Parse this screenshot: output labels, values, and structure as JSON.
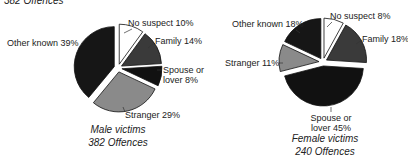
{
  "top_caption_partial": "382 Offences",
  "colors": {
    "No suspect": "#ffffff",
    "Family": "#3a3a3a",
    "Spouse or lover": "#111111",
    "Stranger": "#8a8a8a",
    "Other known": "#161616"
  },
  "chart_data": [
    {
      "type": "pie",
      "title": "Male victims",
      "subtitle": "382 Offences",
      "slices": [
        {
          "label": "No suspect",
          "value": 10,
          "display": "No suspect 10%"
        },
        {
          "label": "Family",
          "value": 14,
          "display": "Family 14%"
        },
        {
          "label": "Spouse or lover",
          "value": 8,
          "display": [
            "Spouse or",
            "lover 8%"
          ]
        },
        {
          "label": "Stranger",
          "value": 29,
          "display": "Stranger 29%"
        },
        {
          "label": "Other known",
          "value": 39,
          "display": "Other known 39%"
        }
      ],
      "exploded": true,
      "legend": "none"
    },
    {
      "type": "pie",
      "title": "Female victims",
      "subtitle": "240 Offences",
      "slices": [
        {
          "label": "No suspect",
          "value": 8,
          "display": "No suspect 8%"
        },
        {
          "label": "Family",
          "value": 18,
          "display": "Family 18%"
        },
        {
          "label": "Spouse or lover",
          "value": 45,
          "display": [
            "Spouse or",
            "lover 45%"
          ]
        },
        {
          "label": "Stranger",
          "value": 11,
          "display": "Stranger 11%"
        },
        {
          "label": "Other known",
          "value": 18,
          "display": "Other known 18%"
        }
      ],
      "exploded": true,
      "legend": "none"
    }
  ]
}
